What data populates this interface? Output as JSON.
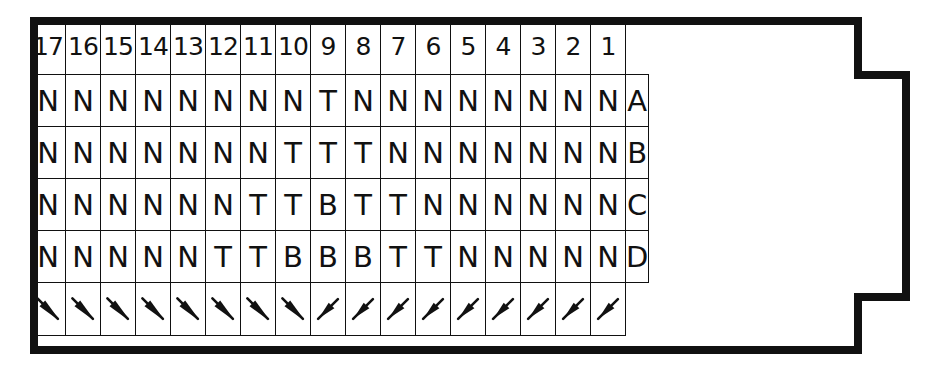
{
  "columns": [
    "17",
    "16",
    "15",
    "14",
    "13",
    "12",
    "11",
    "10",
    "9",
    "8",
    "7",
    "6",
    "5",
    "4",
    "3",
    "2",
    "1"
  ],
  "rows": [
    {
      "label": "A",
      "cells": [
        "N",
        "N",
        "N",
        "N",
        "N",
        "N",
        "N",
        "N",
        "T",
        "N",
        "N",
        "N",
        "N",
        "N",
        "N",
        "N",
        "N"
      ]
    },
    {
      "label": "B",
      "cells": [
        "N",
        "N",
        "N",
        "N",
        "N",
        "N",
        "N",
        "T",
        "T",
        "T",
        "N",
        "N",
        "N",
        "N",
        "N",
        "N",
        "N"
      ]
    },
    {
      "label": "C",
      "cells": [
        "N",
        "N",
        "N",
        "N",
        "N",
        "N",
        "T",
        "T",
        "B",
        "T",
        "T",
        "N",
        "N",
        "N",
        "N",
        "N",
        "N"
      ]
    },
    {
      "label": "D",
      "cells": [
        "N",
        "N",
        "N",
        "N",
        "N",
        "T",
        "T",
        "B",
        "B",
        "B",
        "T",
        "T",
        "N",
        "N",
        "N",
        "N",
        "N"
      ]
    }
  ],
  "arrows": [
    "down-right",
    "down-right",
    "down-right",
    "down-right",
    "down-right",
    "down-right",
    "down-right",
    "down-right",
    "up-right",
    "up-right",
    "up-right",
    "up-right",
    "up-right",
    "up-right",
    "up-right",
    "up-right",
    "up-right"
  ],
  "colors": {
    "ink": "#111111",
    "paper": "#ffffff"
  }
}
